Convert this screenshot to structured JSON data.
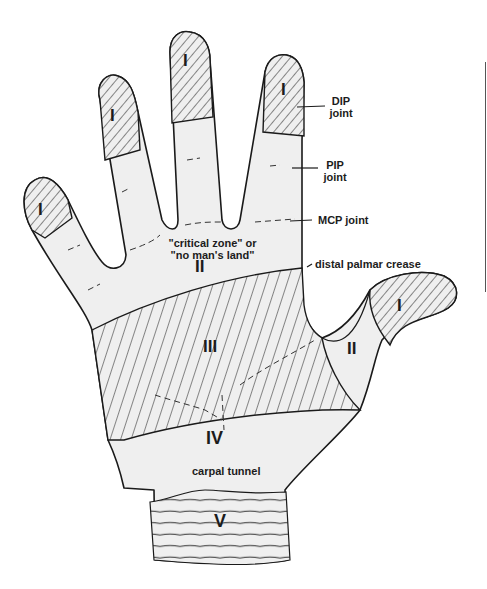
{
  "diagram": {
    "colors": {
      "outline": "#1a1a1a",
      "fill": "#efefef",
      "hatch": "#2a2a2a",
      "background": "#ffffff"
    },
    "zone_labels": {
      "index_tip": "I",
      "middle_tip": "I",
      "ring_tip": "I",
      "little_tip": "I",
      "thumb_tip": "I",
      "palm_zone2": "II",
      "thumb_zone2": "II",
      "zone3": "III",
      "zone4": "IV",
      "zone5": "V"
    },
    "annotations": {
      "dip_line1": "DIP",
      "dip_line2": "joint",
      "pip_line1": "PIP",
      "pip_line2": "joint",
      "mcp": "MCP joint",
      "critical_line1": "\"critical zone\" or",
      "critical_line2": "\"no man's land\"",
      "distal_palmar_crease": "distal palmar crease",
      "carpal_tunnel": "carpal tunnel"
    }
  }
}
